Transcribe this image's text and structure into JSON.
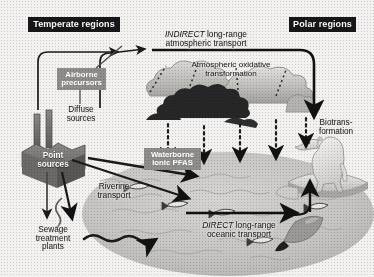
{
  "figure": {
    "width": 374,
    "height": 277
  },
  "region_labels": [
    {
      "id": "temperate",
      "text": "Temperate regions",
      "style": "dark"
    },
    {
      "id": "polar",
      "text": "Polar regions",
      "style": "dark"
    }
  ],
  "pathway_labels": {
    "indirect_italic": "INDIRECT",
    "indirect_rest": " long-range",
    "indirect_line2": "atmospheric transport",
    "direct_italic": "DIRECT",
    "direct_rest": " long-range",
    "direct_line2": "oceanic transport",
    "atmospheric_oxidative_l1": "Atmospheric oxidative",
    "atmospheric_oxidative_l2": "transformation",
    "biotransformation_l1": "Biotrans-",
    "biotransformation_l2": "formation",
    "riverine_l1": "Riverine",
    "riverine_l2": "transport"
  },
  "source_labels": {
    "airborne_l1": "Airborne",
    "airborne_l2": "precursors",
    "diffuse_l1": "Diffuse",
    "diffuse_l2": "sources",
    "point_l1": "Point",
    "point_l2": "sources",
    "sewage_l1": "Sewage",
    "sewage_l2": "treatment",
    "sewage_l3": "plants",
    "waterborne_l1": "Waterborne",
    "waterborne_l2": "ionic PFAS"
  },
  "colors": {
    "background": "#f2f1ef",
    "label_dark_bg": "#17171a",
    "label_dark_text": "#fdfdfb",
    "label_gray_bg": "#8e8d8b",
    "label_gray_text": "#ffffff",
    "ink": "#141414",
    "ocean": "#c9c7c3",
    "cloud_light": "#c3c2bf",
    "cloud_dark": "#272727",
    "ice": "#d8d7d3",
    "bear": "#e7e6e2",
    "factory": "#6f6e6c"
  },
  "scene_elements": [
    {
      "name": "factory-point-source",
      "kind": "illustration"
    },
    {
      "name": "cloud-light-left",
      "kind": "illustration"
    },
    {
      "name": "cloud-dark-center",
      "kind": "illustration"
    },
    {
      "name": "cloud-gray-right",
      "kind": "illustration"
    },
    {
      "name": "ocean-ellipse",
      "kind": "illustration"
    },
    {
      "name": "ice-floe",
      "kind": "illustration"
    },
    {
      "name": "polar-bear",
      "kind": "illustration"
    },
    {
      "name": "whale",
      "kind": "illustration"
    },
    {
      "name": "fish",
      "kind": "illustration",
      "count": 5
    },
    {
      "name": "deposition-arrow",
      "kind": "arrow",
      "count": 5,
      "style": "dashed-down"
    },
    {
      "name": "atmospheric-transport-arrow",
      "kind": "arrow",
      "style": "solid-right"
    },
    {
      "name": "oceanic-transport-arrow",
      "kind": "arrow",
      "style": "solid-right"
    },
    {
      "name": "riverine-arrow",
      "kind": "arrow",
      "count": 2,
      "style": "solid"
    },
    {
      "name": "uptake-arrow",
      "kind": "arrow",
      "style": "solid-up"
    }
  ]
}
